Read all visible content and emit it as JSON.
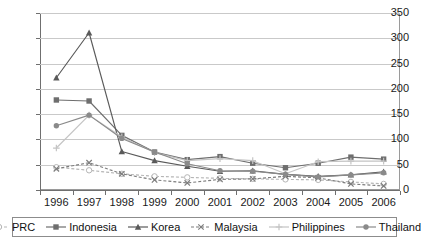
{
  "chart_data": {
    "type": "line",
    "title": "",
    "subtitle": "",
    "xlabel": "",
    "ylabel": "",
    "categories": [
      "1996",
      "1997",
      "1998",
      "1999",
      "2000",
      "2001",
      "2002",
      "2003",
      "2004",
      "2005",
      "2006"
    ],
    "ylim": [
      0,
      350
    ],
    "ytick_values": [
      0,
      50,
      100,
      150,
      200,
      250,
      300,
      350
    ],
    "ytick_labels": [
      "0",
      "50",
      "100",
      "150",
      "200",
      "250",
      "300",
      "350"
    ],
    "grid": true,
    "legend_position": "bottom",
    "series": [
      {
        "name": "PRC",
        "color": "#b5b5b5",
        "marker": "open-circle",
        "dash": "dashed",
        "values": [
          45,
          39,
          32,
          27,
          25,
          23,
          22,
          21,
          20,
          16,
          12
        ]
      },
      {
        "name": "Indonesia",
        "color": "#6e6e6e",
        "marker": "filled-square",
        "dash": "solid",
        "values": [
          178,
          176,
          108,
          75,
          60,
          66,
          53,
          44,
          53,
          65,
          61
        ]
      },
      {
        "name": "Korea",
        "color": "#5a5a5a",
        "marker": "filled-triangle",
        "dash": "solid",
        "values": [
          222,
          311,
          76,
          58,
          47,
          37,
          38,
          31,
          27,
          30,
          36
        ]
      },
      {
        "name": "Malaysia",
        "color": "#7d7d7d",
        "marker": "x-cross",
        "dash": "dashed",
        "values": [
          42,
          54,
          32,
          20,
          14,
          21,
          22,
          27,
          24,
          12,
          8
        ]
      },
      {
        "name": "Philippines",
        "color": "#c4c4c4",
        "marker": "plus",
        "dash": "solid",
        "values": [
          83,
          148,
          105,
          74,
          58,
          62,
          58,
          32,
          56,
          57,
          57
        ]
      },
      {
        "name": "Thailand",
        "color": "#8a8a8a",
        "marker": "filled-circle",
        "dash": "solid",
        "values": [
          127,
          148,
          102,
          75,
          52,
          38,
          37,
          31,
          26,
          30,
          34
        ]
      }
    ]
  },
  "legend": {
    "items": [
      {
        "label": "PRC"
      },
      {
        "label": "Indonesia"
      },
      {
        "label": "Korea"
      },
      {
        "label": "Malaysia"
      },
      {
        "label": "Philippines"
      },
      {
        "label": "Thailand"
      }
    ]
  }
}
